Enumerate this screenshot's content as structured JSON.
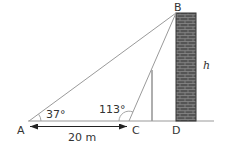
{
  "diagram": {
    "type": "trigonometry-elevation",
    "points": {
      "A": "A",
      "B": "B",
      "C": "C",
      "D": "D"
    },
    "angles": {
      "A": "37°",
      "C": "113°"
    },
    "distance_AC": "20 m",
    "height_label": "h",
    "colors": {
      "lines": "#9a9a9a",
      "wall_fill": "#555555",
      "wall_mortar": "#8a8a8a",
      "ground": "#9a9a9a",
      "text": "#333333"
    }
  }
}
